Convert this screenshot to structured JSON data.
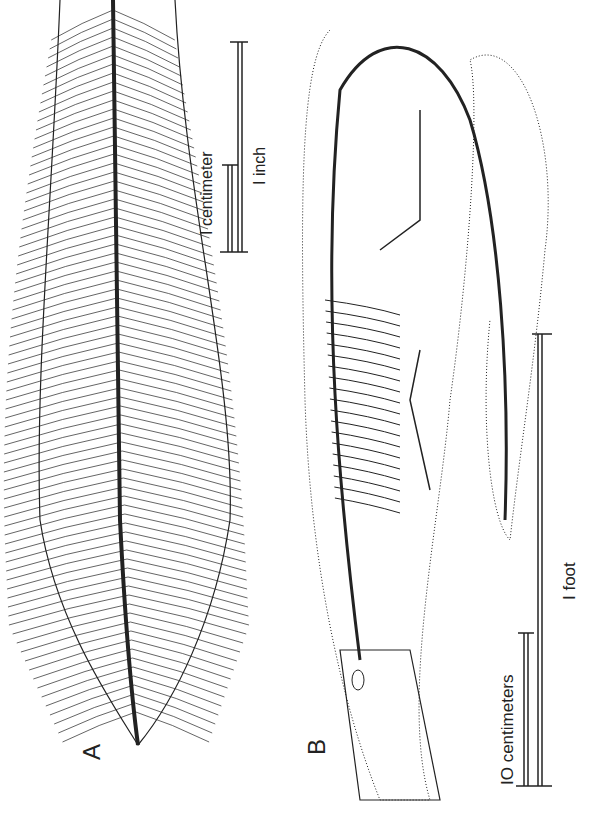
{
  "figure": {
    "panel_a": {
      "label": "A",
      "subject": "leaf-shaped feathered structure with central rachis",
      "scale_bars": [
        {
          "label": "1 centimeter",
          "text": "I centimeter"
        },
        {
          "label": "1 inch",
          "text": "I inch"
        }
      ]
    },
    "panel_b": {
      "label": "B",
      "subject": "marine reptile skeleton with body outline",
      "scale_bars": [
        {
          "label": "10 centimeters",
          "text": "IO centimeters"
        },
        {
          "label": "1 foot",
          "text": "I foot"
        }
      ]
    },
    "colors": {
      "ink": "#222222",
      "background": "#ffffff"
    }
  }
}
